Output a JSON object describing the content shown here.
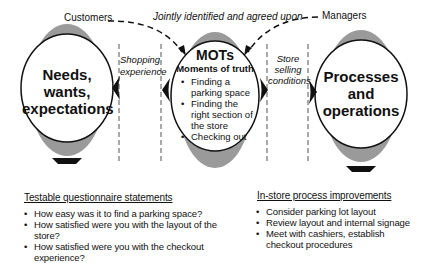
{
  "labels": {
    "customers": "Customers",
    "jointly": "Jointly identified and agreed upon",
    "managers": "Managers",
    "shopping_experience": [
      "Shopping",
      "experience"
    ],
    "store_selling_conditions": [
      "Store",
      "selling",
      "conditions"
    ]
  },
  "left_circle": {
    "lines": [
      "Needs,",
      "wants,",
      "expectations"
    ]
  },
  "center_circle": {
    "title": "MOTs",
    "subtitle": "Moments of truth",
    "items": [
      "Finding a parking space",
      "Finding the right section of the store",
      "Checking out"
    ]
  },
  "right_circle": {
    "lines": [
      "Processes",
      "and",
      "operations"
    ]
  },
  "testable": {
    "title": "Testable questionnaire statements",
    "items": [
      "How easy was it to find a parking space?",
      "How satisfied were you with the layout of the store?",
      "How satisfied were you with the checkout experience?"
    ]
  },
  "improvements": {
    "title": "In-store process improvements",
    "items": [
      "Consider parking lot layout",
      "Review layout and internal signage",
      "Meet with cashiers, establish checkout procedures"
    ]
  },
  "colors": {
    "shade": "#9a9a9a",
    "stroke": "#111111"
  }
}
